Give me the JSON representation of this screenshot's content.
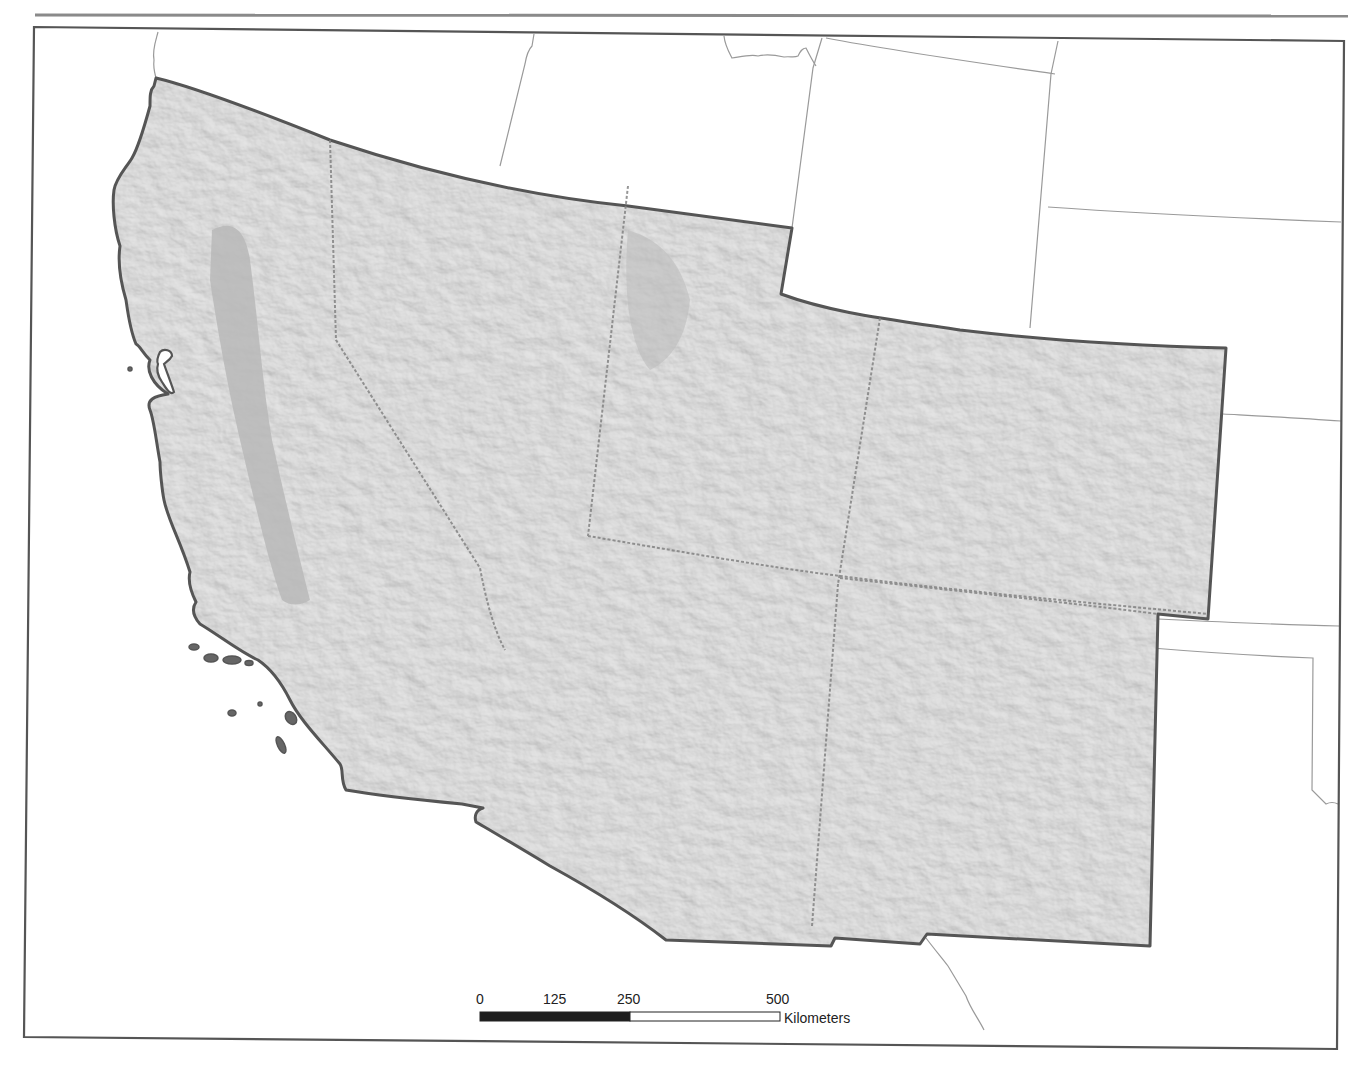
{
  "map": {
    "type": "shaded-relief",
    "region": "Southwestern United States",
    "states_shaded": [
      "California",
      "Nevada",
      "Utah",
      "Arizona",
      "Colorado",
      "New Mexico"
    ],
    "colors": {
      "relief_fill": "#b4b4b4",
      "region_outline": "#555555",
      "state_lines": "#8a8a8a",
      "neighbor_lines": "#9a9a9a",
      "frame": "#555555",
      "background": "#ffffff"
    }
  },
  "scale_bar": {
    "ticks": [
      "0",
      "125",
      "250",
      "500"
    ],
    "unit": "Kilometers",
    "segments": [
      {
        "from": 0,
        "to": 250,
        "fill": "#1e1e1e"
      },
      {
        "from": 250,
        "to": 500,
        "fill": "#ffffff"
      }
    ],
    "max": 500
  }
}
